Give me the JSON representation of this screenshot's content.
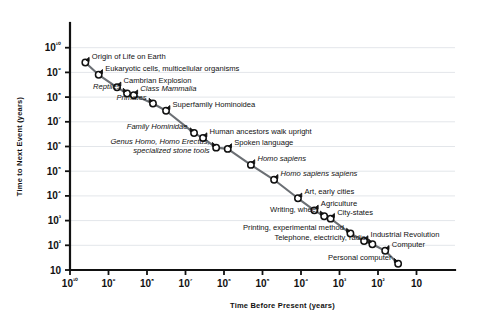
{
  "chart_data": {
    "type": "line",
    "title": "",
    "xlabel": "Time Before Present (years)",
    "ylabel": "Time to Next Event (years)",
    "x_scale": "log",
    "y_scale": "log",
    "x_reversed": true,
    "xlim": [
      10000000000,
      10
    ],
    "ylim": [
      10,
      10000000000
    ],
    "grid": "horizontal",
    "legend": "none",
    "x_tick_labels": [
      "10¹⁰",
      "10⁹",
      "10⁸",
      "10⁷",
      "10⁶",
      "10⁵",
      "10⁴",
      "10³",
      "10²",
      "10"
    ],
    "y_tick_labels": [
      "10¹⁰",
      "10⁹",
      "10⁸",
      "10⁷",
      "10⁶",
      "10⁵",
      "10⁴",
      "10³",
      "10²",
      "10"
    ],
    "x_ticks": [
      10000000000,
      1000000000,
      100000000,
      10000000,
      1000000,
      100000,
      10000,
      1000,
      100,
      10
    ],
    "y_ticks": [
      10000000000,
      1000000000,
      100000000,
      10000000,
      1000000,
      100000,
      10000,
      1000,
      100,
      10
    ],
    "series": [
      {
        "name": "Major evolutionary and technological events",
        "points": [
          {
            "label": "Origin of Life on Earth",
            "x": 4000000000,
            "y": 2500000000,
            "label_side": "right",
            "italic": false
          },
          {
            "label": "Eukaryotic cells, multicellular organisms",
            "x": 1800000000,
            "y": 800000000,
            "label_side": "right",
            "italic": false
          },
          {
            "label": "Cambrian Explosion",
            "x": 600000000,
            "y": 250000000,
            "label_side": "right",
            "italic": false
          },
          {
            "label": "Reptiles",
            "x": 330000000,
            "y": 140000000,
            "label_side": "left",
            "italic": true
          },
          {
            "label": "Class Mammalia",
            "x": 220000000,
            "y": 120000000,
            "label_side": "right",
            "italic": true
          },
          {
            "label": "Primates",
            "x": 70000000,
            "y": 55000000,
            "label_side": "left",
            "italic": true
          },
          {
            "label": "Superfamily Hominoidea",
            "x": 32000000,
            "y": 28000000,
            "label_side": "right",
            "italic": false
          },
          {
            "label": "Family Hominidae",
            "x": 6000000,
            "y": 3500000,
            "label_side": "left",
            "italic": true
          },
          {
            "label": "Human ancestors walk upright",
            "x": 3500000,
            "y": 2200000,
            "label_side": "right",
            "italic": false
          },
          {
            "label": "Genus Homo, Homo Erectus, specialized stone tools",
            "x": 1600000,
            "y": 900000,
            "label_side": "left",
            "italic": true
          },
          {
            "label": "Spoken language",
            "x": 800000,
            "y": 800000,
            "label_side": "right",
            "italic": false
          },
          {
            "label": "Homo sapiens",
            "x": 200000,
            "y": 180000,
            "label_side": "right",
            "italic": true
          },
          {
            "label": "Homo sapiens sapiens",
            "x": 50000,
            "y": 45000,
            "label_side": "right",
            "italic": true
          },
          {
            "label": "Art, early cities",
            "x": 12000,
            "y": 8000,
            "label_side": "right",
            "italic": false
          },
          {
            "label": "Agriculture",
            "x": 4500,
            "y": 2600,
            "label_side": "right",
            "italic": false
          },
          {
            "label": "Writing, wheel",
            "x": 2500,
            "y": 1500,
            "label_side": "left",
            "italic": false
          },
          {
            "label": "City-states",
            "x": 1700,
            "y": 1200,
            "label_side": "right",
            "italic": false
          },
          {
            "label": "Printing, experimental method",
            "x": 520,
            "y": 300,
            "label_side": "left",
            "italic": false
          },
          {
            "label": "Industrial Revolution",
            "x": 230,
            "y": 150,
            "label_side": "right",
            "italic": false
          },
          {
            "label": "Telephone, electricity, radio",
            "x": 140,
            "y": 110,
            "label_side": "left",
            "italic": false
          },
          {
            "label": "Computer",
            "x": 65,
            "y": 60,
            "label_side": "right",
            "italic": false
          },
          {
            "label": "Personal computer",
            "x": 30,
            "y": 18,
            "label_side": "left",
            "italic": false
          }
        ]
      }
    ]
  }
}
